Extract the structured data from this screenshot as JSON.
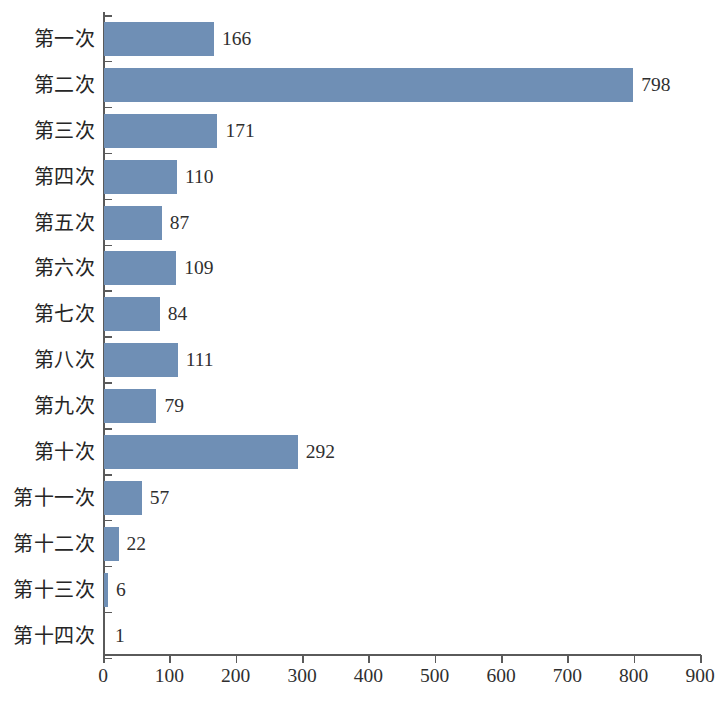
{
  "chart_data": {
    "type": "bar",
    "orientation": "horizontal",
    "title": "",
    "xlabel": "",
    "ylabel": "",
    "categories": [
      "第一次",
      "第二次",
      "第三次",
      "第四次",
      "第五次",
      "第六次",
      "第七次",
      "第八次",
      "第九次",
      "第十次",
      "第十一次",
      "第十二次",
      "第十三次",
      "第十四次"
    ],
    "values": [
      166,
      798,
      171,
      110,
      87,
      109,
      84,
      111,
      79,
      292,
      57,
      22,
      6,
      1
    ],
    "value_labels": [
      "166",
      "798",
      "171",
      "110",
      "87",
      "109",
      "84",
      "111",
      "79",
      "292",
      "57",
      "22",
      "6",
      "1"
    ],
    "xlim": [
      0,
      900
    ],
    "xticks": [
      0,
      100,
      200,
      300,
      400,
      500,
      600,
      700,
      800,
      900
    ],
    "xtick_labels": [
      "0",
      "100",
      "200",
      "300",
      "400",
      "500",
      "600",
      "700",
      "800",
      "900"
    ],
    "grid": false,
    "legend": false,
    "bar_color": "#6f8fb5",
    "axis_color": "#5a5a5a",
    "text_color": "#2f2f2f",
    "background_color": "#ffffff"
  }
}
